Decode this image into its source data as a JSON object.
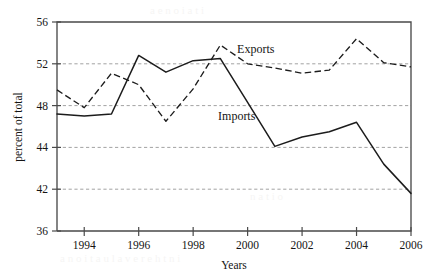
{
  "chart_data": {
    "type": "line",
    "title": "",
    "xlabel": "Years",
    "ylabel": "percent of total",
    "x": [
      1993,
      1994,
      1995,
      1996,
      1997,
      1998,
      1999,
      2000,
      2001,
      2002,
      2003,
      2004,
      2005,
      2006
    ],
    "xlim": [
      1993,
      2006
    ],
    "ylim": [
      36,
      56
    ],
    "ytick_labels": [
      "56",
      "52",
      "48",
      "44",
      "42",
      "36"
    ],
    "ytick_values": [
      56,
      52,
      48,
      44,
      42,
      36
    ],
    "xtick_labels": [
      "1994",
      "1996",
      "1998",
      "2000",
      "2002",
      "2004",
      "2006"
    ],
    "xtick_values": [
      1994,
      1996,
      1998,
      2000,
      2002,
      2004,
      2006
    ],
    "gridlines": {
      "axis": "y",
      "values": [
        52,
        48,
        44,
        42
      ],
      "style": "dashed"
    },
    "legend_position": "inline-annotation",
    "series": [
      {
        "name": "Exports",
        "style": "dashed",
        "color": "#1c1c1c",
        "label_x": 2000.3,
        "label_y": 53.0,
        "values": [
          49.5,
          47.8,
          51.1,
          50.0,
          46.5,
          49.6,
          53.8,
          52.0,
          51.6,
          51.1,
          51.4,
          54.4,
          52.1,
          51.7
        ]
      },
      {
        "name": "Imports",
        "style": "solid",
        "color": "#1c1c1c",
        "label_x": 1999.6,
        "label_y": 46.6,
        "values": [
          47.2,
          47.0,
          47.2,
          52.8,
          51.2,
          52.3,
          52.5,
          48.3,
          44.1,
          45.0,
          45.5,
          46.4,
          43.2,
          41.4
        ]
      }
    ]
  },
  "annotations": {
    "exports_label": "Exports",
    "imports_label": "Imports"
  },
  "axes": {
    "y_title": "percent of total",
    "x_title": "Years"
  }
}
